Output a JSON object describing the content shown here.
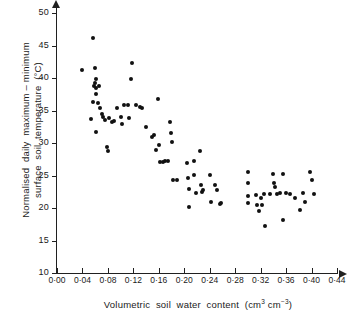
{
  "chart_data": {
    "type": "scatter",
    "title": "",
    "xlabel": "Volumetric soil water content (cm3 cm-3)",
    "ylabel": "Normalised daily maximum – minimum surface soil temperature (°C)",
    "xlim": [
      0.0,
      0.44
    ],
    "ylim": [
      10,
      50
    ],
    "xticks": [
      0.0,
      0.04,
      0.08,
      0.12,
      0.16,
      0.2,
      0.24,
      0.28,
      0.32,
      0.36,
      0.4,
      0.44
    ],
    "xtick_labels": [
      "0·00",
      "0·04",
      "0·08",
      "0·12",
      "0·16",
      "0·20",
      "0·24",
      "0·28",
      "0·32",
      "0·36",
      "0·40",
      "0·44"
    ],
    "yticks": [
      10,
      15,
      20,
      25,
      30,
      35,
      40,
      45,
      50
    ],
    "ytick_labels": [
      "10",
      "15",
      "20",
      "25",
      "30",
      "35",
      "40",
      "45",
      "50"
    ],
    "grid": false,
    "legend": false,
    "marker": "filled-circle",
    "marker_color": "#111111",
    "points": [
      [
        0.04,
        41.2
      ],
      [
        0.057,
        46.1
      ],
      [
        0.06,
        41.5
      ],
      [
        0.061,
        39.9
      ],
      [
        0.06,
        39.2
      ],
      [
        0.058,
        38.8
      ],
      [
        0.062,
        38.4
      ],
      [
        0.061,
        37.6
      ],
      [
        0.057,
        36.3
      ],
      [
        0.053,
        33.7
      ],
      [
        0.064,
        36.1
      ],
      [
        0.066,
        38.8
      ],
      [
        0.068,
        35.4
      ],
      [
        0.07,
        34.5
      ],
      [
        0.072,
        34.0
      ],
      [
        0.061,
        31.7
      ],
      [
        0.075,
        33.6
      ],
      [
        0.078,
        29.4
      ],
      [
        0.08,
        28.7
      ],
      [
        0.082,
        33.9
      ],
      [
        0.086,
        33.3
      ],
      [
        0.09,
        33.4
      ],
      [
        0.095,
        35.4
      ],
      [
        0.1,
        34.0
      ],
      [
        0.102,
        33.0
      ],
      [
        0.106,
        35.8
      ],
      [
        0.112,
        35.9
      ],
      [
        0.113,
        33.8
      ],
      [
        0.118,
        42.3
      ],
      [
        0.117,
        39.9
      ],
      [
        0.124,
        35.8
      ],
      [
        0.13,
        35.6
      ],
      [
        0.134,
        35.4
      ],
      [
        0.14,
        32.4
      ],
      [
        0.15,
        31.0
      ],
      [
        0.152,
        31.2
      ],
      [
        0.155,
        28.9
      ],
      [
        0.158,
        36.8
      ],
      [
        0.16,
        29.7
      ],
      [
        0.162,
        27.1
      ],
      [
        0.166,
        27.1
      ],
      [
        0.17,
        27.2
      ],
      [
        0.174,
        27.2
      ],
      [
        0.178,
        33.2
      ],
      [
        0.179,
        31.5
      ],
      [
        0.18,
        30.1
      ],
      [
        0.183,
        24.3
      ],
      [
        0.188,
        24.3
      ],
      [
        0.205,
        27.0
      ],
      [
        0.206,
        24.6
      ],
      [
        0.208,
        22.9
      ],
      [
        0.207,
        20.1
      ],
      [
        0.215,
        25.1
      ],
      [
        0.216,
        27.3
      ],
      [
        0.218,
        22.3
      ],
      [
        0.224,
        28.8
      ],
      [
        0.226,
        23.6
      ],
      [
        0.228,
        22.5
      ],
      [
        0.229,
        22.7
      ],
      [
        0.24,
        25.1
      ],
      [
        0.242,
        20.9
      ],
      [
        0.248,
        23.5
      ],
      [
        0.252,
        22.7
      ],
      [
        0.256,
        20.6
      ],
      [
        0.258,
        20.7
      ],
      [
        0.3,
        25.5
      ],
      [
        0.3,
        23.9
      ],
      [
        0.3,
        21.9
      ],
      [
        0.3,
        20.8
      ],
      [
        0.313,
        22.0
      ],
      [
        0.315,
        20.5
      ],
      [
        0.317,
        19.5
      ],
      [
        0.32,
        21.6
      ],
      [
        0.322,
        20.4
      ],
      [
        0.326,
        22.2
      ],
      [
        0.327,
        17.2
      ],
      [
        0.334,
        22.2
      ],
      [
        0.34,
        25.3
      ],
      [
        0.341,
        23.9
      ],
      [
        0.342,
        23.2
      ],
      [
        0.346,
        22.2
      ],
      [
        0.35,
        22.3
      ],
      [
        0.355,
        25.3
      ],
      [
        0.355,
        18.1
      ],
      [
        0.36,
        22.3
      ],
      [
        0.366,
        22.2
      ],
      [
        0.374,
        21.6
      ],
      [
        0.382,
        19.7
      ],
      [
        0.386,
        22.3
      ],
      [
        0.39,
        20.9
      ],
      [
        0.398,
        25.5
      ],
      [
        0.4,
        24.3
      ],
      [
        0.404,
        22.1
      ]
    ]
  }
}
